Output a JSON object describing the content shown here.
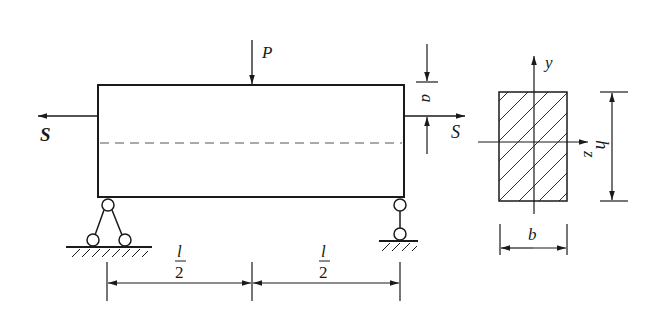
{
  "diagram": {
    "type": "simply-supported beam with axial tension and midspan point load",
    "beam": {
      "labels": {
        "point_load": "P",
        "axial_force_left": "S",
        "axial_force_right": "S",
        "eccentricity": "a",
        "span_half_left_num": "l",
        "span_half_left_den": "2",
        "span_half_right_num": "l",
        "span_half_right_den": "2"
      },
      "supports": [
        "pin (left)",
        "roller (right)"
      ],
      "centerline": "dashed"
    },
    "cross_section": {
      "shape": "rectangle",
      "fill": "hatched",
      "labels": {
        "y_axis": "y",
        "z_axis": "z",
        "height": "h",
        "width": "b"
      }
    },
    "colors": {
      "stroke": "#1a1a1a",
      "background": "#ffffff"
    }
  }
}
